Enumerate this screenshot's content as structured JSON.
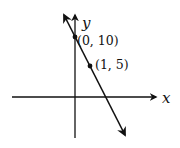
{
  "diagram": {
    "type": "coordinate-graph",
    "axes": {
      "x_label": "x",
      "y_label": "y"
    },
    "line": {
      "description": "line through two labeled points, arrows at both ends",
      "slope": -5,
      "y_intercept": 10
    },
    "points": [
      {
        "label": "(0, 10)",
        "x": 0,
        "y": 10
      },
      {
        "label": "(1, 5)",
        "x": 1,
        "y": 5
      }
    ],
    "colors": {
      "ink": "#111111",
      "background": "#ffffff"
    }
  }
}
